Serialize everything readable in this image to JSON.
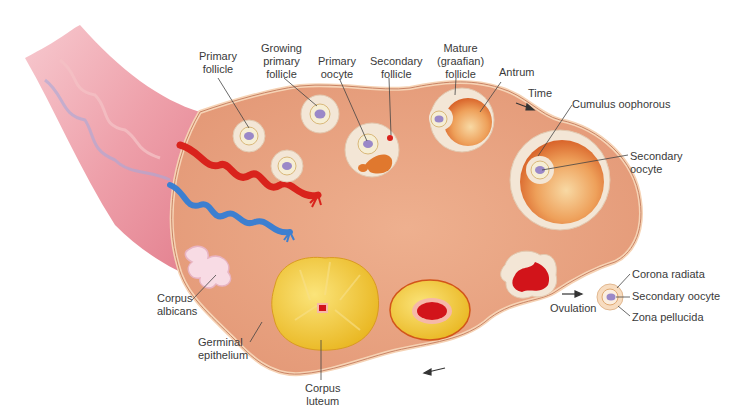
{
  "diagram": {
    "colors": {
      "ovary_tissue": "#e9a27e",
      "ovary_edge": "#f3c9a8",
      "ligament": "#e8909c",
      "artery": "#d9231c",
      "vein": "#3d7fd0",
      "follicle_granulosa": "#f3e6d6",
      "antrum": "#e88a3c",
      "oocyte": "#9a88c8",
      "corpus_luteum": "#f2cc2e",
      "blood": "#d2141a",
      "corpus_albicans": "#f7d8e2",
      "label_text": "#3a3a3a",
      "leader_line": "#444444"
    },
    "labels": {
      "primary_follicle": "Primary\nfollicle",
      "growing_primary_follicle": "Growing\nprimary\nfollicle",
      "primary_oocyte": "Primary\noocyte",
      "secondary_follicle": "Secondary\nfollicle",
      "mature_follicle": "Mature\n(graafian)\nfollicle",
      "antrum": "Antrum",
      "time": "Time",
      "cumulus_oophorous": "Cumulus oophorous",
      "secondary_oocyte": "Secondary\noocyte",
      "corona_radiata": "Corona radiata",
      "secondary_oocyte_released": "Secondary oocyte",
      "zona_pellucida": "Zona pellucida",
      "ovulation": "Ovulation",
      "corpus_albicans": "Corpus\nalbicans",
      "germinal_epithelium": "Germinal\nepithelium",
      "corpus_luteum": "Corpus\nluteum"
    }
  }
}
